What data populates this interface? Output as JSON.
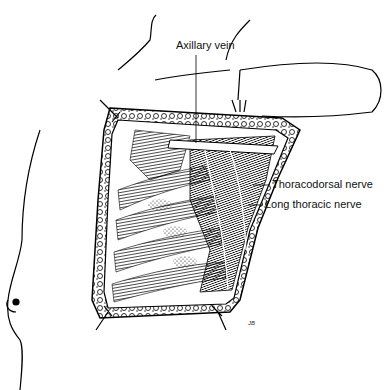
{
  "figure": {
    "labels": [
      {
        "id": "axillary-vein",
        "text": "Axillary vein"
      },
      {
        "id": "thoracodorsal-nerve",
        "text": "Thoracodorsal nerve"
      },
      {
        "id": "long-thoracic-nerve",
        "text": "Long thoracic nerve"
      }
    ],
    "signature": "JB"
  }
}
